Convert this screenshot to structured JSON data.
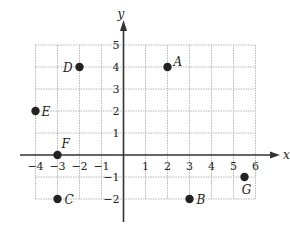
{
  "chart_data": {
    "type": "scatter",
    "title": "",
    "xlabel": "x",
    "ylabel": "y",
    "xlim": [
      -4,
      6
    ],
    "ylim": [
      -2,
      5
    ],
    "grid": true,
    "grid_style": "dotted",
    "x_ticks": [
      -4,
      -3,
      -2,
      -1,
      1,
      2,
      3,
      4,
      5,
      6
    ],
    "y_ticks": [
      -2,
      -1,
      1,
      2,
      3,
      4,
      5
    ],
    "points": [
      {
        "label": "A",
        "x": 2,
        "y": 4
      },
      {
        "label": "B",
        "x": 3,
        "y": -2
      },
      {
        "label": "C",
        "x": -3,
        "y": -2
      },
      {
        "label": "D",
        "x": -2,
        "y": 4
      },
      {
        "label": "E",
        "x": -4,
        "y": 2
      },
      {
        "label": "F",
        "x": -3,
        "y": 0
      },
      {
        "label": "G",
        "x": 5.5,
        "y": -1
      }
    ]
  },
  "layout": {
    "origin_px": [
      123.5,
      155
    ],
    "unit_px": 22,
    "colors": {
      "axis": "#333333",
      "grid": "#b8b8b8",
      "point": "#222222"
    }
  }
}
